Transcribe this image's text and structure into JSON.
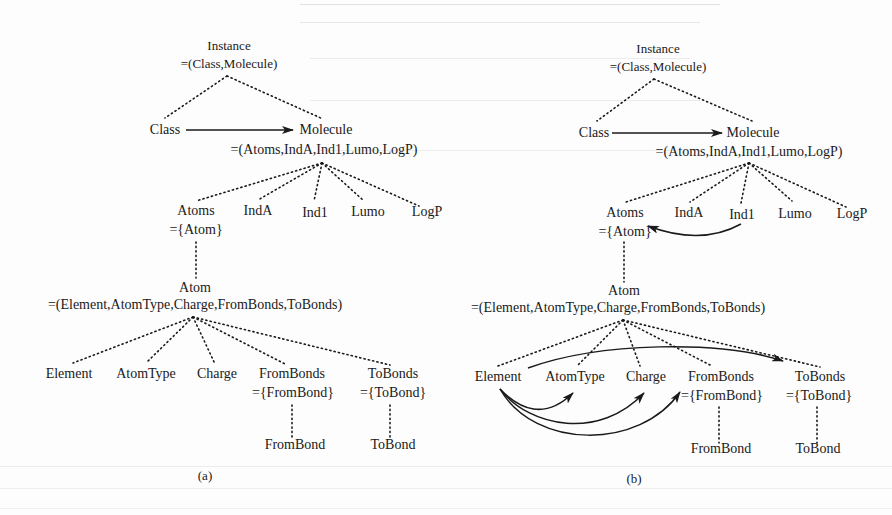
{
  "figure": {
    "panels": [
      {
        "caption": "(a)",
        "nodes": {
          "instance": "Instance",
          "instance_def": "=(Class,Molecule)",
          "class": "Class",
          "molecule": "Molecule",
          "molecule_def": "=(Atoms,IndA,Ind1,Lumo,LogP)",
          "atoms": "Atoms",
          "atoms_def": "={Atom}",
          "inda": "IndA",
          "ind1": "Ind1",
          "lumo": "Lumo",
          "logp": "LogP",
          "atom": "Atom",
          "atom_def": "=(Element,AtomType,Charge,FromBonds,ToBonds)",
          "element": "Element",
          "atomtype": "AtomType",
          "charge": "Charge",
          "frombonds": "FromBonds",
          "frombonds_def": "={FromBond}",
          "tobonds": "ToBonds",
          "tobonds_def": "={ToBond}",
          "frombond": "FromBond",
          "tobond": "ToBond"
        },
        "arrows": [
          {
            "from": "Class",
            "to": "Molecule",
            "style": "solid-straight"
          }
        ]
      },
      {
        "caption": "(b)",
        "nodes": {
          "instance": "Instance",
          "instance_def": "=(Class,Molecule)",
          "class": "Class",
          "molecule": "Molecule",
          "molecule_def": "=(Atoms,IndA,Ind1,Lumo,LogP)",
          "atoms": "Atoms",
          "atoms_def": "={Atom}",
          "inda": "IndA",
          "ind1": "Ind1",
          "lumo": "Lumo",
          "logp": "LogP",
          "atom": "Atom",
          "atom_def": "=(Element,AtomType,Charge,FromBonds,ToBonds)",
          "element": "Element",
          "atomtype": "AtomType",
          "charge": "Charge",
          "frombonds": "FromBonds",
          "frombonds_def": "={FromBond}",
          "tobonds": "ToBonds",
          "tobonds_def": "={ToBond}",
          "frombond": "FromBond",
          "tobond": "ToBond"
        },
        "arrows": [
          {
            "from": "Class",
            "to": "Molecule",
            "style": "solid-straight"
          },
          {
            "from": "Ind1",
            "to": "Atoms",
            "style": "solid-curved"
          },
          {
            "from": "Element",
            "to": "ToBonds",
            "style": "solid-curved"
          },
          {
            "from": "Element",
            "to": "AtomType",
            "style": "solid-curved"
          },
          {
            "from": "Element",
            "to": "Charge",
            "style": "solid-curved"
          },
          {
            "from": "Element",
            "to": "FromBonds",
            "style": "solid-curved"
          }
        ]
      }
    ],
    "colors": {
      "ink": "#1a1a1a",
      "background": "#fdfdfd",
      "bleed_through": "#d6d6d6"
    }
  }
}
